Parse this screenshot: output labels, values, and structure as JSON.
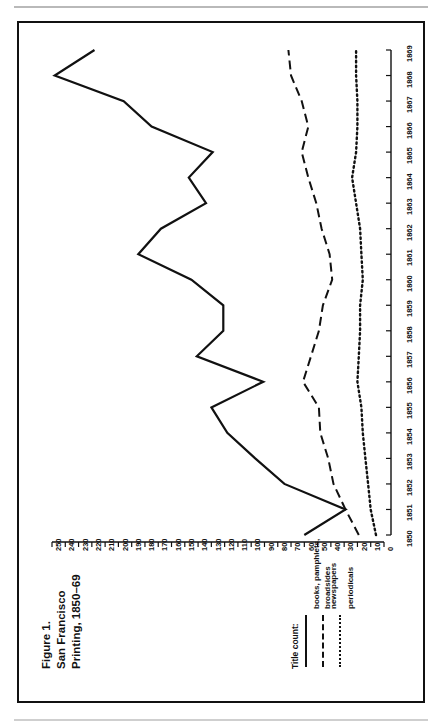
{
  "figure": {
    "title_lines": [
      "Figure 1.",
      "San Francisco",
      "Printing, 1850–69"
    ]
  },
  "legend": {
    "heading": "Title count:",
    "items": [
      {
        "label_lines": [
          "books, pamphlets,",
          "broadsides"
        ],
        "style": "solid"
      },
      {
        "label_lines": [
          "newspapers"
        ],
        "style": "dashed"
      },
      {
        "label_lines": [
          "periodicals"
        ],
        "style": "dotted"
      }
    ]
  },
  "chart_data": {
    "type": "line",
    "orientation": "rotated-90ccw",
    "xlabel": "",
    "ylabel": "Title count",
    "grid": false,
    "legend_position": "bottom-left",
    "x": [
      1850,
      1851,
      1852,
      1853,
      1854,
      1855,
      1856,
      1857,
      1858,
      1859,
      1860,
      1861,
      1862,
      1863,
      1864,
      1865,
      1866,
      1867,
      1868,
      1869
    ],
    "xlim": [
      1850,
      1869
    ],
    "xticks": [
      "1850",
      "1851",
      "1852",
      "1853",
      "1854",
      "1855",
      "1856",
      "1857",
      "1858",
      "1859",
      "1860",
      "1861",
      "1862",
      "1863",
      "1864",
      "1865",
      "1866",
      "1867",
      "1868",
      "1869"
    ],
    "ylim": [
      0,
      250
    ],
    "yticks": [
      250,
      240,
      230,
      220,
      210,
      200,
      190,
      180,
      170,
      160,
      150,
      140,
      130,
      120,
      110,
      100,
      90,
      80,
      70,
      60,
      50,
      40,
      30,
      20,
      10,
      0
    ],
    "ytick_labels": [
      "250",
      "240",
      "230",
      "220",
      "210",
      "200",
      "190",
      "180",
      "170",
      "160",
      "150",
      "140",
      "130",
      "120",
      "110",
      "100",
      "90",
      "80",
      "70",
      "60",
      "50",
      "40",
      "30",
      "20",
      "10",
      "0"
    ],
    "series": [
      {
        "name": "books, pamphlets, broadsides",
        "style": "solid",
        "values": [
          60,
          29,
          75,
          97,
          118,
          130,
          91,
          141,
          121,
          121,
          145,
          185,
          168,
          134,
          147,
          129,
          175,
          196,
          248,
          218
        ]
      },
      {
        "name": "newspapers",
        "style": "dashed",
        "values": [
          19,
          29,
          38,
          42,
          48,
          49,
          61,
          55,
          49,
          46,
          39,
          41,
          47,
          51,
          57,
          62,
          57,
          62,
          70,
          72
        ]
      },
      {
        "name": "periodicals",
        "style": "dotted",
        "values": [
          6,
          10,
          12,
          14,
          16,
          17,
          20,
          19,
          18,
          18,
          16,
          17,
          18,
          21,
          24,
          21,
          20,
          20,
          21,
          21
        ]
      }
    ]
  }
}
